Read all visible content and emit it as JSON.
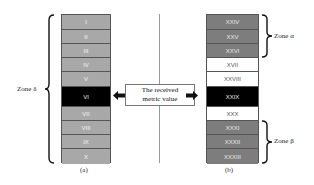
{
  "panel_a": {
    "caption": "(a)",
    "zone_label": "Zone δ",
    "cells": [
      {
        "label": "I",
        "shade": "lightgray"
      },
      {
        "label": "II",
        "shade": "lightgray"
      },
      {
        "label": "III",
        "shade": "lightgray"
      },
      {
        "label": "IV",
        "shade": "lightgray"
      },
      {
        "label": "V",
        "shade": "lightgray"
      },
      {
        "label": "VI",
        "shade": "black"
      },
      {
        "label": "VII",
        "shade": "lightgray"
      },
      {
        "label": "VIII",
        "shade": "lightgray"
      },
      {
        "label": "IX",
        "shade": "lightgray"
      },
      {
        "label": "X",
        "shade": "lightgray"
      }
    ]
  },
  "panel_b": {
    "caption": "(b)",
    "zone_alpha_label": "Zone α",
    "zone_beta_label": "Zone β",
    "cells": [
      {
        "label": "XXIV",
        "shade": "darkgray"
      },
      {
        "label": "XXV",
        "shade": "darkgray"
      },
      {
        "label": "XXVI",
        "shade": "darkgray"
      },
      {
        "label": "XVII",
        "shade": "white"
      },
      {
        "label": "XXVIII",
        "shade": "white"
      },
      {
        "label": "XXIX",
        "shade": "black"
      },
      {
        "label": "XXX",
        "shade": "white"
      },
      {
        "label": "XXXI",
        "shade": "darkgray"
      },
      {
        "label": "XXXII",
        "shade": "darkgray"
      },
      {
        "label": "XXXIII",
        "shade": "darkgray"
      }
    ]
  },
  "callout": {
    "line1": "The received",
    "line2": "metric value"
  },
  "colors": {
    "light_gray": "#a8a8a8",
    "dark_gray": "#7d7d7d",
    "highlight": "#000000"
  }
}
